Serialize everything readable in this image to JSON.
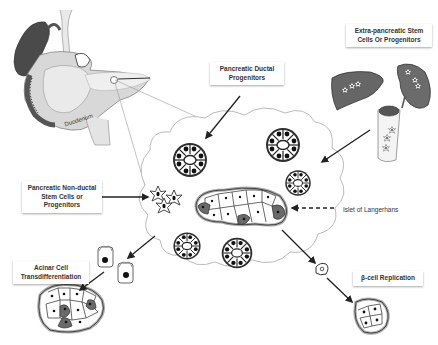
{
  "diagram": {
    "title": "",
    "labels": {
      "duodenum": "Duodenum",
      "pancreatic_ductal": [
        "Pancreatic Ductal",
        "Progenitors"
      ],
      "extra_pancreatic": [
        "Extra-pancreatic Stem",
        "Cells Or Progenitors"
      ],
      "non_ductal": [
        "Pancreatic Non-ductal",
        "Stem Cells or",
        "Progenitors"
      ],
      "islet": "Islet of Langerhans",
      "acinar": [
        "Acinar Cell",
        "Transdifferentiation"
      ],
      "beta_replication": "β-cell Replication"
    },
    "nodes": [
      {
        "id": "pancreas",
        "kind": "organ-illustration"
      },
      {
        "id": "tissue-cloud",
        "kind": "magnified-tissue"
      },
      {
        "id": "liver",
        "kind": "organ-illustration"
      },
      {
        "id": "spleen",
        "kind": "organ-illustration"
      },
      {
        "id": "bone-marrow",
        "kind": "organ-illustration"
      },
      {
        "id": "acinar-cells",
        "kind": "cell-pair"
      },
      {
        "id": "beta-cell",
        "kind": "single-cell"
      },
      {
        "id": "acinar-derived-islet",
        "kind": "cell-cluster"
      },
      {
        "id": "replicated-islet",
        "kind": "cell-cluster"
      }
    ],
    "edges": [
      {
        "from": "pancreatic_ductal",
        "to": "tissue-cloud",
        "style": "solid"
      },
      {
        "from": "extra_pancreatic",
        "to": "tissue-cloud",
        "style": "solid"
      },
      {
        "from": "non_ductal",
        "to": "tissue-cloud",
        "style": "solid"
      },
      {
        "from": "islet",
        "to": "tissue-cloud",
        "style": "dashed"
      },
      {
        "from": "tissue-cloud",
        "to": "acinar-cells",
        "style": "solid"
      },
      {
        "from": "acinar-cells",
        "to": "acinar-derived-islet",
        "style": "solid"
      },
      {
        "from": "tissue-cloud",
        "to": "beta-cell",
        "style": "solid"
      },
      {
        "from": "beta-cell",
        "to": "replicated-islet",
        "style": "solid"
      }
    ]
  }
}
